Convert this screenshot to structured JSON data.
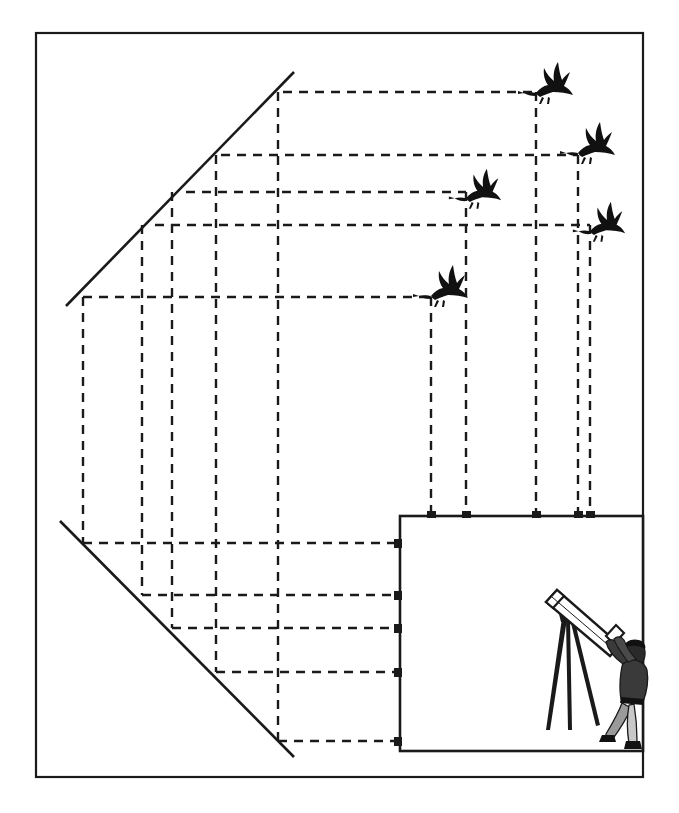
{
  "figure": {
    "background_color": "#ffffff",
    "ink_color": "#1a1a1a",
    "width": 679,
    "height": 813
  },
  "outer_frame": {
    "label": "outer-frame",
    "x": 36,
    "y": 33,
    "width": 607,
    "height": 744,
    "stroke": "#1a1a1a",
    "stroke_width": 2.2
  },
  "image_plane_panel": {
    "label": "image-plane-panel",
    "x": 400,
    "y": 516,
    "width": 243,
    "height": 235,
    "stroke": "#1a1a1a",
    "stroke_width": 2.6
  },
  "sight_lines": [
    {
      "name": "upper-sight-line",
      "x1": 66,
      "y1": 306,
      "x2": 294,
      "y2": 72
    },
    {
      "name": "lower-sight-line",
      "x1": 60,
      "y1": 521,
      "x2": 294,
      "y2": 757
    }
  ],
  "dash_style": {
    "pattern": "9 7",
    "stroke_width": 2.4,
    "stroke": "#1a1a1a"
  },
  "horizontal_projection_lines": [
    {
      "name": "bird-1-horizontal",
      "y": 92,
      "x_start": 283,
      "x_end": 536
    },
    {
      "name": "bird-2-horizontal",
      "y": 155,
      "x_start": 221,
      "x_end": 578
    },
    {
      "name": "bird-3-horizontal",
      "y": 192,
      "x_start": 186,
      "x_end": 466
    },
    {
      "name": "bird-4-horizontal",
      "y": 225,
      "x_start": 155,
      "x_end": 590
    },
    {
      "name": "bird-5-horizontal",
      "y": 297,
      "x_start": 83,
      "x_end": 431
    },
    {
      "name": "plane-row-1-horizontal",
      "y": 543,
      "x_start": 83,
      "x_end": 400
    },
    {
      "name": "plane-row-2-horizontal",
      "y": 595,
      "x_start": 142,
      "x_end": 400
    },
    {
      "name": "plane-row-3-horizontal",
      "y": 628,
      "x_start": 172,
      "x_end": 400
    },
    {
      "name": "plane-row-4-horizontal",
      "y": 672,
      "x_start": 216,
      "x_end": 400
    },
    {
      "name": "plane-row-5-horizontal",
      "y": 741,
      "x_start": 278,
      "x_end": 400
    }
  ],
  "vertical_projection_lines": [
    {
      "name": "col-a-vertical",
      "x": 83,
      "y_start": 297,
      "y_end": 543
    },
    {
      "name": "col-b-vertical",
      "x": 142,
      "y_start": 225,
      "y_end": 595
    },
    {
      "name": "col-c-vertical",
      "x": 172,
      "y_start": 192,
      "y_end": 628
    },
    {
      "name": "col-d-vertical",
      "x": 216,
      "y_start": 155,
      "y_end": 672
    },
    {
      "name": "col-e-vertical",
      "x": 278,
      "y_start": 92,
      "y_end": 741
    },
    {
      "name": "bird-5-drop-vertical",
      "x": 431,
      "y_start": 297,
      "y_end": 516
    },
    {
      "name": "bird-3-drop-vertical",
      "x": 466,
      "y_start": 192,
      "y_end": 516
    },
    {
      "name": "bird-1-drop-vertical",
      "x": 536,
      "y_start": 92,
      "y_end": 516
    },
    {
      "name": "bird-2-drop-vertical",
      "x": 578,
      "y_start": 155,
      "y_end": 516
    },
    {
      "name": "bird-4-drop-vertical",
      "x": 590,
      "y_start": 225,
      "y_end": 516
    }
  ],
  "birds": [
    {
      "name": "bird-1",
      "label": "flying-bird-icon",
      "x": 536,
      "y": 79,
      "scale": 1.0
    },
    {
      "name": "bird-2",
      "label": "flying-bird-icon",
      "x": 578,
      "y": 139,
      "scale": 1.0
    },
    {
      "name": "bird-3",
      "label": "flying-bird-icon",
      "x": 466,
      "y": 185,
      "scale": 0.95
    },
    {
      "name": "bird-4",
      "label": "flying-bird-icon",
      "x": 590,
      "y": 218,
      "scale": 0.95
    },
    {
      "name": "bird-5",
      "label": "flying-bird-icon",
      "x": 431,
      "y": 282,
      "scale": 1.0
    }
  ],
  "observer": {
    "name": "astronomer-with-telescope",
    "x": 544,
    "y": 598,
    "width": 100,
    "height": 153,
    "parts": {
      "telescope": "telescope-tube",
      "tripod": "tripod-legs",
      "person": "standing-observer"
    }
  }
}
